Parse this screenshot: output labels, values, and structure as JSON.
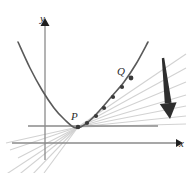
{
  "figure": {
    "background_color": "#ffffff"
  },
  "axes": {
    "x_label": "x",
    "y_label": "y",
    "axis_color": "#8a8a8a",
    "arrow_color": "#1f1f1f",
    "x_axis": {
      "y": 143,
      "x_start": 12,
      "x_end": 176
    },
    "y_axis": {
      "x": 45,
      "y_start": 160,
      "y_end": 26
    }
  },
  "curve": {
    "name": "parabola",
    "color": "#5a5a5a",
    "stroke_width": 1.6,
    "vertex": {
      "x": 76,
      "y": 128
    },
    "path_points": [
      {
        "x": 18,
        "y": 42
      },
      {
        "x": 30,
        "y": 68
      },
      {
        "x": 42,
        "y": 90
      },
      {
        "x": 54,
        "y": 108
      },
      {
        "x": 64,
        "y": 119
      },
      {
        "x": 76,
        "y": 128
      },
      {
        "x": 88,
        "y": 122
      },
      {
        "x": 100,
        "y": 110
      },
      {
        "x": 112,
        "y": 96
      },
      {
        "x": 124,
        "y": 82
      },
      {
        "x": 136,
        "y": 64
      },
      {
        "x": 148,
        "y": 42
      }
    ]
  },
  "tangent_line": {
    "name": "horizontal-tangent-at-P",
    "color": "#8a8a8a",
    "y": 126,
    "x_start": 28,
    "x_end": 158
  },
  "secant_lines": {
    "color": "#d2d2d2",
    "stroke_width": 1.1,
    "origin": {
      "x": 78,
      "y": 127
    },
    "far_endpoints": [
      {
        "x": 186,
        "y": 54
      },
      {
        "x": 186,
        "y": 68
      },
      {
        "x": 186,
        "y": 82
      },
      {
        "x": 186,
        "y": 95
      },
      {
        "x": 186,
        "y": 106
      },
      {
        "x": 186,
        "y": 116
      },
      {
        "x": 186,
        "y": 124
      }
    ],
    "near_endpoints": [
      {
        "x": 2,
        "y": 177
      },
      {
        "x": 16,
        "y": 177
      },
      {
        "x": 30,
        "y": 177
      },
      {
        "x": 44,
        "y": 173
      },
      {
        "x": 18,
        "y": 158
      },
      {
        "x": 10,
        "y": 150
      },
      {
        "x": 6,
        "y": 143
      }
    ]
  },
  "points": [
    {
      "id": "P",
      "label": "P",
      "x": 78,
      "y": 127,
      "radius": 2.3,
      "color": "#3a3a3a"
    },
    {
      "id": "d1",
      "label": "",
      "x": 87,
      "y": 123,
      "radius": 2.1,
      "color": "#3a3a3a"
    },
    {
      "id": "d2",
      "label": "",
      "x": 96,
      "y": 116,
      "radius": 2.1,
      "color": "#3a3a3a"
    },
    {
      "id": "d3",
      "label": "",
      "x": 104,
      "y": 108,
      "radius": 2.1,
      "color": "#3a3a3a"
    },
    {
      "id": "d4",
      "label": "",
      "x": 113,
      "y": 97,
      "radius": 2.1,
      "color": "#3a3a3a"
    },
    {
      "id": "d5",
      "label": "",
      "x": 122,
      "y": 87,
      "radius": 2.1,
      "color": "#3a3a3a"
    },
    {
      "id": "Q",
      "label": "Q",
      "x": 131,
      "y": 78,
      "radius": 2.4,
      "color": "#3a3a3a"
    }
  ],
  "direction_arrow": {
    "name": "downward-direction-arrow",
    "color": "#2e2e2e",
    "tip": {
      "x": 170,
      "y": 119
    },
    "tail": {
      "x": 163,
      "y": 58
    },
    "description": "Large solid arrow pointing down, indicating Q sliding toward P"
  }
}
